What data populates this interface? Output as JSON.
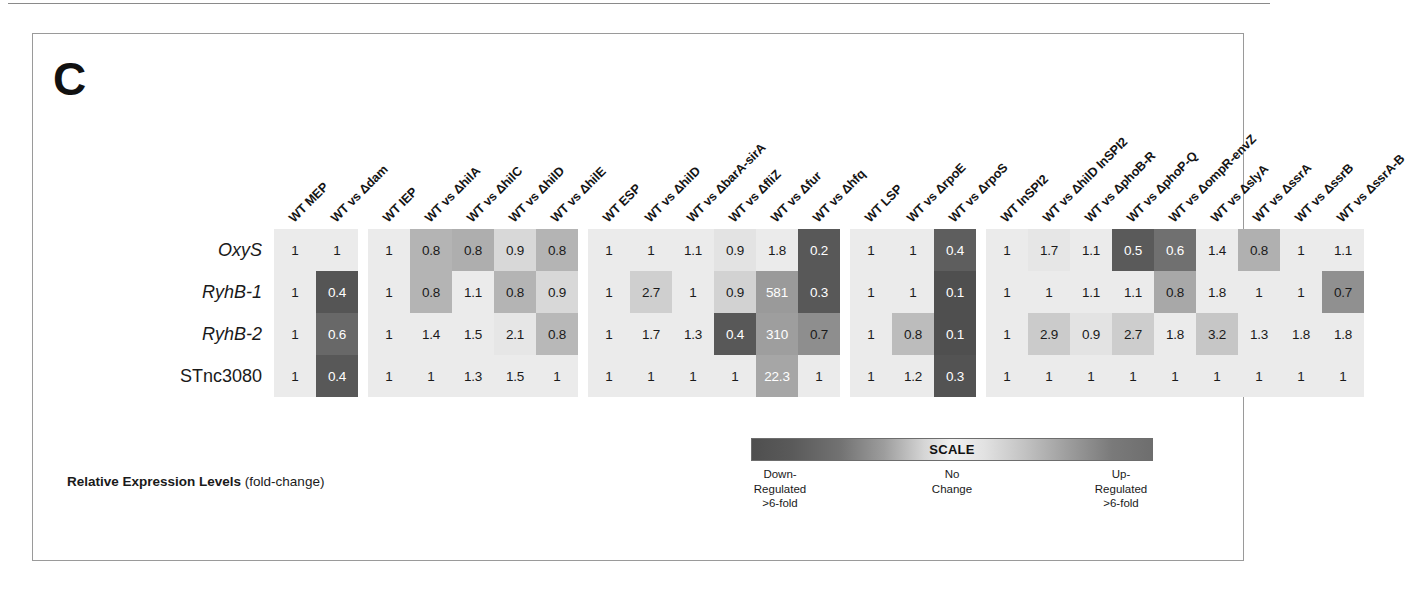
{
  "panel": {
    "letter": "C"
  },
  "caption": {
    "bold": "Relative Expression Levels",
    "normal": " (fold-change)"
  },
  "legend": {
    "title": "SCALE",
    "left": "Down-\nRegulated\n>6-fold",
    "left_lines": [
      "Down-",
      "Regulated",
      ">6-fold"
    ],
    "mid_lines": [
      "No",
      "Change"
    ],
    "right_lines": [
      "Up-",
      "Regulated",
      ">6-fold"
    ],
    "gradient_left": "#4f4f4f",
    "gradient_mid": "#f0f0f0",
    "gradient_right": "#6e6e6e"
  },
  "chart_data": {
    "type": "heatmap",
    "title": "Relative Expression Levels (fold-change)",
    "xlabel": "",
    "ylabel": "",
    "legend_position": "bottom-right",
    "grid": false,
    "row_labels": [
      "OxyS",
      "RyhB-1",
      "RyhB-2",
      "STnc3080"
    ],
    "row_italic": [
      true,
      true,
      true,
      false
    ],
    "column_blocks": [
      {
        "name": "MEP",
        "columns": [
          "WT MEP",
          "WT vs Δdam"
        ]
      },
      {
        "name": "IEP",
        "columns": [
          "WT IEP",
          "WT vs ΔhilA",
          "WT vs ΔhilC",
          "WT vs ΔhilD",
          "WT vs ΔhilE"
        ]
      },
      {
        "name": "ESP",
        "columns": [
          "WT ESP",
          "WT vs ΔhilD",
          "WT vs ΔbarA-sirA",
          "WT vs ΔfliZ",
          "WT vs Δfur",
          "WT vs Δhfq"
        ]
      },
      {
        "name": "LSP",
        "columns": [
          "WT LSP",
          "WT vs ΔrpoE",
          "WT vs ΔrpoS"
        ]
      },
      {
        "name": "InSPI2",
        "columns": [
          "WT InSPI2",
          "WT vs ΔhilD InSPI2",
          "WT vs ΔphoB-R",
          "WT vs ΔphoP-Q",
          "WT vs ΔompR-envZ",
          "WT vs ΔslyA",
          "WT vs ΔssrA",
          "WT vs ΔssrB",
          "WT vs ΔssrA-B"
        ]
      }
    ],
    "columns_flat": [
      "WT MEP",
      "WT vs Δdam",
      "WT IEP",
      "WT vs ΔhilA",
      "WT vs ΔhilC",
      "WT vs ΔhilD",
      "WT vs ΔhilE",
      "WT ESP",
      "WT vs ΔhilD",
      "WT vs ΔbarA-sirA",
      "WT vs ΔfliZ",
      "WT vs Δfur",
      "WT vs Δhfq",
      "WT LSP",
      "WT vs ΔrpoE",
      "WT vs ΔrpoS",
      "WT InSPI2",
      "WT vs ΔhilD InSPI2",
      "WT vs ΔphoB-R",
      "WT vs ΔphoP-Q",
      "WT vs ΔompR-envZ",
      "WT vs ΔslyA",
      "WT vs ΔssrA",
      "WT vs ΔssrB",
      "WT vs ΔssrA-B"
    ],
    "rows": [
      {
        "label": "OxyS",
        "italic": true,
        "blocks": [
          [
            {
              "value": "1",
              "num": 1,
              "bg": "#ebebeb",
              "light": false
            },
            {
              "value": "1",
              "num": 1,
              "bg": "#ebebeb",
              "light": false
            }
          ],
          [
            {
              "value": "1",
              "num": 1,
              "bg": "#ebebeb",
              "light": false
            },
            {
              "value": "0.8",
              "num": 0.8,
              "bg": "#b4b4b4",
              "light": false
            },
            {
              "value": "0.8",
              "num": 0.8,
              "bg": "#aeaeae",
              "light": false
            },
            {
              "value": "0.9",
              "num": 0.9,
              "bg": "#d8d8d8",
              "light": false
            },
            {
              "value": "0.8",
              "num": 0.8,
              "bg": "#b4b4b4",
              "light": false
            }
          ],
          [
            {
              "value": "1",
              "num": 1,
              "bg": "#ebebeb",
              "light": false
            },
            {
              "value": "1",
              "num": 1,
              "bg": "#ebebeb",
              "light": false
            },
            {
              "value": "1.1",
              "num": 1.1,
              "bg": "#ebebeb",
              "light": false
            },
            {
              "value": "0.9",
              "num": 0.9,
              "bg": "#e3e3e3",
              "light": false
            },
            {
              "value": "1.8",
              "num": 1.8,
              "bg": "#ebebeb",
              "light": false
            },
            {
              "value": "0.2",
              "num": 0.2,
              "bg": "#585858",
              "light": true
            }
          ],
          [
            {
              "value": "1",
              "num": 1,
              "bg": "#ebebeb",
              "light": false
            },
            {
              "value": "1",
              "num": 1,
              "bg": "#ebebeb",
              "light": false
            },
            {
              "value": "0.4",
              "num": 0.4,
              "bg": "#5e5e5e",
              "light": true
            }
          ],
          [
            {
              "value": "1",
              "num": 1,
              "bg": "#ebebeb",
              "light": false
            },
            {
              "value": "1.7",
              "num": 1.7,
              "bg": "#e6e6e6",
              "light": false
            },
            {
              "value": "1.1",
              "num": 1.1,
              "bg": "#ebebeb",
              "light": false
            },
            {
              "value": "0.5",
              "num": 0.5,
              "bg": "#5a5a5a",
              "light": true
            },
            {
              "value": "0.6",
              "num": 0.6,
              "bg": "#707070",
              "light": true
            },
            {
              "value": "1.4",
              "num": 1.4,
              "bg": "#ebebeb",
              "light": false
            },
            {
              "value": "0.8",
              "num": 0.8,
              "bg": "#b0b0b0",
              "light": false
            },
            {
              "value": "1",
              "num": 1,
              "bg": "#ebebeb",
              "light": false
            },
            {
              "value": "1.1",
              "num": 1.1,
              "bg": "#ebebeb",
              "light": false
            }
          ]
        ]
      },
      {
        "label": "RyhB-1",
        "italic": true,
        "blocks": [
          [
            {
              "value": "1",
              "num": 1,
              "bg": "#ebebeb",
              "light": false
            },
            {
              "value": "0.4",
              "num": 0.4,
              "bg": "#555555",
              "light": true
            }
          ],
          [
            {
              "value": "1",
              "num": 1,
              "bg": "#ebebeb",
              "light": false
            },
            {
              "value": "0.8",
              "num": 0.8,
              "bg": "#b4b4b4",
              "light": false
            },
            {
              "value": "1.1",
              "num": 1.1,
              "bg": "#ebebeb",
              "light": false
            },
            {
              "value": "0.8",
              "num": 0.8,
              "bg": "#b4b4b4",
              "light": false
            },
            {
              "value": "0.9",
              "num": 0.9,
              "bg": "#d8d8d8",
              "light": false
            }
          ],
          [
            {
              "value": "1",
              "num": 1,
              "bg": "#ebebeb",
              "light": false
            },
            {
              "value": "2.7",
              "num": 2.7,
              "bg": "#cfcfcf",
              "light": false
            },
            {
              "value": "1",
              "num": 1,
              "bg": "#ebebeb",
              "light": false
            },
            {
              "value": "0.9",
              "num": 0.9,
              "bg": "#d2d2d2",
              "light": false
            },
            {
              "value": "581",
              "num": 581,
              "bg": "#9a9a9a",
              "light": true
            },
            {
              "value": "0.3",
              "num": 0.3,
              "bg": "#585858",
              "light": true
            }
          ],
          [
            {
              "value": "1",
              "num": 1,
              "bg": "#ebebeb",
              "light": false
            },
            {
              "value": "1",
              "num": 1,
              "bg": "#ebebeb",
              "light": false
            },
            {
              "value": "0.1",
              "num": 0.1,
              "bg": "#4f4f4f",
              "light": true
            }
          ],
          [
            {
              "value": "1",
              "num": 1,
              "bg": "#ebebeb",
              "light": false
            },
            {
              "value": "1",
              "num": 1,
              "bg": "#ebebeb",
              "light": false
            },
            {
              "value": "1.1",
              "num": 1.1,
              "bg": "#ebebeb",
              "light": false
            },
            {
              "value": "1.1",
              "num": 1.1,
              "bg": "#ebebeb",
              "light": false
            },
            {
              "value": "0.8",
              "num": 0.8,
              "bg": "#a8a8a8",
              "light": false
            },
            {
              "value": "1.8",
              "num": 1.8,
              "bg": "#ebebeb",
              "light": false
            },
            {
              "value": "1",
              "num": 1,
              "bg": "#ebebeb",
              "light": false
            },
            {
              "value": "1",
              "num": 1,
              "bg": "#ebebeb",
              "light": false
            },
            {
              "value": "0.7",
              "num": 0.7,
              "bg": "#909090",
              "light": false
            }
          ]
        ]
      },
      {
        "label": "RyhB-2",
        "italic": true,
        "blocks": [
          [
            {
              "value": "1",
              "num": 1,
              "bg": "#ebebeb",
              "light": false
            },
            {
              "value": "0.6",
              "num": 0.6,
              "bg": "#686868",
              "light": true
            }
          ],
          [
            {
              "value": "1",
              "num": 1,
              "bg": "#ebebeb",
              "light": false
            },
            {
              "value": "1.4",
              "num": 1.4,
              "bg": "#ebebeb",
              "light": false
            },
            {
              "value": "1.5",
              "num": 1.5,
              "bg": "#ebebeb",
              "light": false
            },
            {
              "value": "2.1",
              "num": 2.1,
              "bg": "#e6e6e6",
              "light": false
            },
            {
              "value": "0.8",
              "num": 0.8,
              "bg": "#b8b8b8",
              "light": false
            }
          ],
          [
            {
              "value": "1",
              "num": 1,
              "bg": "#ebebeb",
              "light": false
            },
            {
              "value": "1.7",
              "num": 1.7,
              "bg": "#ebebeb",
              "light": false
            },
            {
              "value": "1.3",
              "num": 1.3,
              "bg": "#ebebeb",
              "light": false
            },
            {
              "value": "0.4",
              "num": 0.4,
              "bg": "#585858",
              "light": true
            },
            {
              "value": "310",
              "num": 310,
              "bg": "#9e9e9e",
              "light": true
            },
            {
              "value": "0.7",
              "num": 0.7,
              "bg": "#8e8e8e",
              "light": false
            }
          ],
          [
            {
              "value": "1",
              "num": 1,
              "bg": "#ebebeb",
              "light": false
            },
            {
              "value": "0.8",
              "num": 0.8,
              "bg": "#bcbcbc",
              "light": false
            },
            {
              "value": "0.1",
              "num": 0.1,
              "bg": "#4f4f4f",
              "light": true
            }
          ],
          [
            {
              "value": "1",
              "num": 1,
              "bg": "#ebebeb",
              "light": false
            },
            {
              "value": "2.9",
              "num": 2.9,
              "bg": "#cbcbcb",
              "light": false
            },
            {
              "value": "0.9",
              "num": 0.9,
              "bg": "#e3e3e3",
              "light": false
            },
            {
              "value": "2.7",
              "num": 2.7,
              "bg": "#cdcdcd",
              "light": false
            },
            {
              "value": "1.8",
              "num": 1.8,
              "bg": "#ebebeb",
              "light": false
            },
            {
              "value": "3.2",
              "num": 3.2,
              "bg": "#c6c6c6",
              "light": false
            },
            {
              "value": "1.3",
              "num": 1.3,
              "bg": "#ebebeb",
              "light": false
            },
            {
              "value": "1.8",
              "num": 1.8,
              "bg": "#ebebeb",
              "light": false
            },
            {
              "value": "1.8",
              "num": 1.8,
              "bg": "#ebebeb",
              "light": false
            }
          ]
        ]
      },
      {
        "label": "STnc3080",
        "italic": false,
        "blocks": [
          [
            {
              "value": "1",
              "num": 1,
              "bg": "#ebebeb",
              "light": false
            },
            {
              "value": "0.4",
              "num": 0.4,
              "bg": "#585858",
              "light": true
            }
          ],
          [
            {
              "value": "1",
              "num": 1,
              "bg": "#ebebeb",
              "light": false
            },
            {
              "value": "1",
              "num": 1,
              "bg": "#ebebeb",
              "light": false
            },
            {
              "value": "1.3",
              "num": 1.3,
              "bg": "#ebebeb",
              "light": false
            },
            {
              "value": "1.5",
              "num": 1.5,
              "bg": "#ebebeb",
              "light": false
            },
            {
              "value": "1",
              "num": 1,
              "bg": "#ebebeb",
              "light": false
            }
          ],
          [
            {
              "value": "1",
              "num": 1,
              "bg": "#ebebeb",
              "light": false
            },
            {
              "value": "1",
              "num": 1,
              "bg": "#ebebeb",
              "light": false
            },
            {
              "value": "1",
              "num": 1,
              "bg": "#ebebeb",
              "light": false
            },
            {
              "value": "1",
              "num": 1,
              "bg": "#ebebeb",
              "light": false
            },
            {
              "value": "22.3",
              "num": 22.3,
              "bg": "#a6a6a6",
              "light": true
            },
            {
              "value": "1",
              "num": 1,
              "bg": "#ebebeb",
              "light": false
            }
          ],
          [
            {
              "value": "1",
              "num": 1,
              "bg": "#ebebeb",
              "light": false
            },
            {
              "value": "1.2",
              "num": 1.2,
              "bg": "#ebebeb",
              "light": false
            },
            {
              "value": "0.3",
              "num": 0.3,
              "bg": "#535353",
              "light": true
            }
          ],
          [
            {
              "value": "1",
              "num": 1,
              "bg": "#ebebeb",
              "light": false
            },
            {
              "value": "1",
              "num": 1,
              "bg": "#ebebeb",
              "light": false
            },
            {
              "value": "1",
              "num": 1,
              "bg": "#ebebeb",
              "light": false
            },
            {
              "value": "1",
              "num": 1,
              "bg": "#ebebeb",
              "light": false
            },
            {
              "value": "1",
              "num": 1,
              "bg": "#ebebeb",
              "light": false
            },
            {
              "value": "1",
              "num": 1,
              "bg": "#ebebeb",
              "light": false
            },
            {
              "value": "1",
              "num": 1,
              "bg": "#ebebeb",
              "light": false
            },
            {
              "value": "1",
              "num": 1,
              "bg": "#ebebeb",
              "light": false
            },
            {
              "value": "1",
              "num": 1,
              "bg": "#ebebeb",
              "light": false
            }
          ]
        ]
      }
    ]
  }
}
